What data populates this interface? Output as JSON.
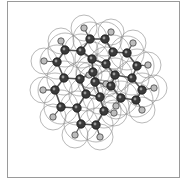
{
  "figure": {
    "colors": {
      "carbon": "#3a3a3a",
      "hydrogen": "#bdbdbd",
      "surface": "#8a8a8a",
      "bond": "#555555",
      "frame": "#9a9a9a"
    }
  },
  "molecule": {
    "carbons": [
      [
        90,
        39
      ],
      [
        105,
        39
      ],
      [
        65,
        50
      ],
      [
        81,
        51
      ],
      [
        113,
        52
      ],
      [
        127,
        53
      ],
      [
        57,
        62
      ],
      [
        92,
        59
      ],
      [
        106,
        64
      ],
      [
        137,
        66
      ],
      [
        64,
        78
      ],
      [
        80,
        79
      ],
      [
        93,
        72
      ],
      [
        115,
        75
      ],
      [
        132,
        78
      ],
      [
        95,
        82
      ],
      [
        111,
        86
      ],
      [
        142,
        90
      ],
      [
        55,
        90
      ],
      [
        86,
        94
      ],
      [
        100,
        97
      ],
      [
        121,
        98
      ],
      [
        136,
        100
      ],
      [
        61,
        107
      ],
      [
        77,
        108
      ],
      [
        104,
        111
      ],
      [
        81,
        124
      ],
      [
        96,
        125
      ]
    ],
    "hydrogens": [
      [
        84,
        28
      ],
      [
        111,
        32
      ],
      [
        61,
        41
      ],
      [
        133,
        43
      ],
      [
        44,
        61
      ],
      [
        148,
        65
      ],
      [
        89,
        75
      ],
      [
        106,
        84
      ],
      [
        43,
        90
      ],
      [
        154,
        88
      ],
      [
        116,
        106
      ],
      [
        53,
        117
      ],
      [
        114,
        113
      ],
      [
        142,
        110
      ],
      [
        75,
        135
      ],
      [
        100,
        137
      ]
    ],
    "bonds": [
      [
        0,
        1
      ],
      [
        0,
        3
      ],
      [
        1,
        4
      ],
      [
        2,
        3
      ],
      [
        2,
        6
      ],
      [
        3,
        7
      ],
      [
        4,
        5
      ],
      [
        4,
        8
      ],
      [
        5,
        9
      ],
      [
        7,
        8
      ],
      [
        7,
        12
      ],
      [
        6,
        10
      ],
      [
        10,
        11
      ],
      [
        11,
        12
      ],
      [
        8,
        13
      ],
      [
        9,
        14
      ],
      [
        13,
        14
      ],
      [
        12,
        15
      ],
      [
        15,
        16
      ],
      [
        13,
        16
      ],
      [
        14,
        17
      ],
      [
        10,
        18
      ],
      [
        11,
        19
      ],
      [
        19,
        20
      ],
      [
        15,
        20
      ],
      [
        16,
        21
      ],
      [
        21,
        22
      ],
      [
        17,
        22
      ],
      [
        18,
        23
      ],
      [
        23,
        24
      ],
      [
        19,
        24
      ],
      [
        20,
        25
      ],
      [
        24,
        26
      ],
      [
        26,
        27
      ],
      [
        25,
        27
      ]
    ],
    "ch_bonds": [
      [
        0,
        0
      ],
      [
        1,
        1
      ],
      [
        2,
        2
      ],
      [
        5,
        3
      ],
      [
        6,
        4
      ],
      [
        9,
        5
      ],
      [
        12,
        6
      ],
      [
        15,
        7
      ],
      [
        18,
        8
      ],
      [
        17,
        9
      ],
      [
        21,
        10
      ],
      [
        23,
        11
      ],
      [
        25,
        12
      ],
      [
        22,
        13
      ],
      [
        26,
        14
      ],
      [
        27,
        15
      ]
    ]
  }
}
